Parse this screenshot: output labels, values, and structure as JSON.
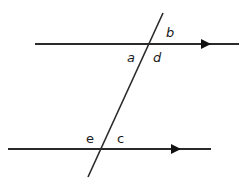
{
  "diagram": {
    "colors": {
      "line": "#2a2a2a",
      "background": "#ffffff",
      "label": "#1a1a1a"
    },
    "lines": {
      "top_parallel": {
        "x1": 35,
        "y1": 44,
        "x2": 239,
        "y2": 44,
        "arrow_x": 208
      },
      "bottom_parallel": {
        "x1": 8,
        "y1": 149,
        "x2": 211,
        "y2": 149,
        "arrow_x": 178
      },
      "transversal": {
        "x1": 163,
        "y1": 13,
        "x2": 88,
        "y2": 177
      }
    },
    "labels": {
      "b": "b",
      "a": "a",
      "d": "d",
      "e": "e",
      "c": "c"
    }
  }
}
